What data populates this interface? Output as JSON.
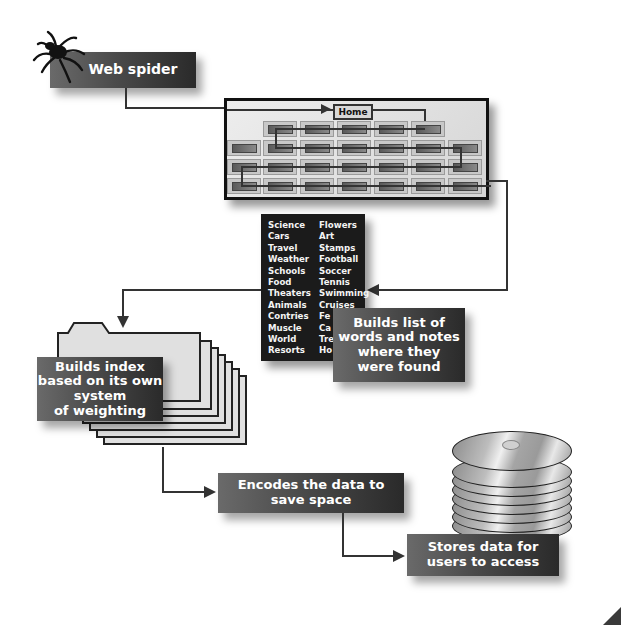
{
  "diagram": {
    "type": "process-flow"
  },
  "nodes": {
    "spider": {
      "label": "Web spider",
      "icon": "spider-icon"
    },
    "website": {
      "home_label": "Home",
      "rows": [
        5,
        7,
        7,
        7
      ]
    },
    "wordlist": {
      "col1": [
        "Science",
        "Cars",
        "Travel",
        "Weather",
        "Schools",
        "Food",
        "Theaters",
        "Animals",
        "Contries",
        "Muscle",
        "World",
        "Resorts"
      ],
      "col2": [
        "Flowers",
        "Art",
        "Stamps",
        "Football",
        "Soccer",
        "Tennis",
        "Swimming",
        "Cruises",
        "Fe",
        "Ca",
        "Tre",
        "Ho"
      ]
    },
    "build_list": {
      "lines": [
        "Builds list of",
        "words and notes",
        "where they",
        "were found"
      ]
    },
    "build_index": {
      "lines": [
        "Builds index",
        "based on its own",
        "system",
        "of weighting"
      ]
    },
    "encode": {
      "lines": [
        "Encodes the data to",
        "save space"
      ]
    },
    "store": {
      "lines": [
        "Stores data for",
        "users to access"
      ],
      "icon": "disc-stack-icon"
    }
  },
  "edges": [
    {
      "from": "spider",
      "to": "website"
    },
    {
      "from": "website",
      "to": "wordlist"
    },
    {
      "from": "wordlist",
      "to": "build_index"
    },
    {
      "from": "build_index",
      "to": "encode"
    },
    {
      "from": "encode",
      "to": "store"
    }
  ],
  "colors": {
    "box_dark": "#2a2a2a",
    "box_light": "#6a6a6a",
    "line": "#333333",
    "background": "#ffffff"
  }
}
